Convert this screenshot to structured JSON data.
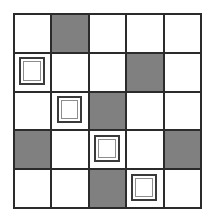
{
  "figure": {
    "name": "five-by-five-grid-pattern",
    "type": "grid-pattern",
    "rows": 5,
    "columns": 5,
    "background_color": "#ffffff",
    "grid_line_color": "#2b2b2b",
    "filled_cell_color": "#808080",
    "empty_cell_color": "#ffffff",
    "inner_square_outline_color": "#3a3a3a"
  },
  "legend": {
    "filled_label": "shaded cell",
    "empty_label": "blank cell",
    "inner_square_label": "cell containing small square outline"
  },
  "cells": [
    {
      "row": 1,
      "col": 1,
      "state": "empty",
      "inner_square": false
    },
    {
      "row": 1,
      "col": 2,
      "state": "filled",
      "inner_square": false
    },
    {
      "row": 1,
      "col": 3,
      "state": "empty",
      "inner_square": false
    },
    {
      "row": 1,
      "col": 4,
      "state": "empty",
      "inner_square": false
    },
    {
      "row": 1,
      "col": 5,
      "state": "empty",
      "inner_square": false
    },
    {
      "row": 2,
      "col": 1,
      "state": "empty",
      "inner_square": true
    },
    {
      "row": 2,
      "col": 2,
      "state": "empty",
      "inner_square": false
    },
    {
      "row": 2,
      "col": 3,
      "state": "empty",
      "inner_square": false
    },
    {
      "row": 2,
      "col": 4,
      "state": "filled",
      "inner_square": false
    },
    {
      "row": 2,
      "col": 5,
      "state": "empty",
      "inner_square": false
    },
    {
      "row": 3,
      "col": 1,
      "state": "empty",
      "inner_square": false
    },
    {
      "row": 3,
      "col": 2,
      "state": "empty",
      "inner_square": true
    },
    {
      "row": 3,
      "col": 3,
      "state": "filled",
      "inner_square": false
    },
    {
      "row": 3,
      "col": 4,
      "state": "empty",
      "inner_square": false
    },
    {
      "row": 3,
      "col": 5,
      "state": "empty",
      "inner_square": false
    },
    {
      "row": 4,
      "col": 1,
      "state": "filled",
      "inner_square": false
    },
    {
      "row": 4,
      "col": 2,
      "state": "empty",
      "inner_square": false
    },
    {
      "row": 4,
      "col": 3,
      "state": "empty",
      "inner_square": true
    },
    {
      "row": 4,
      "col": 4,
      "state": "empty",
      "inner_square": false
    },
    {
      "row": 4,
      "col": 5,
      "state": "filled",
      "inner_square": false
    },
    {
      "row": 5,
      "col": 1,
      "state": "empty",
      "inner_square": false
    },
    {
      "row": 5,
      "col": 2,
      "state": "empty",
      "inner_square": false
    },
    {
      "row": 5,
      "col": 3,
      "state": "filled",
      "inner_square": false
    },
    {
      "row": 5,
      "col": 4,
      "state": "empty",
      "inner_square": true
    },
    {
      "row": 5,
      "col": 5,
      "state": "empty",
      "inner_square": false
    }
  ]
}
